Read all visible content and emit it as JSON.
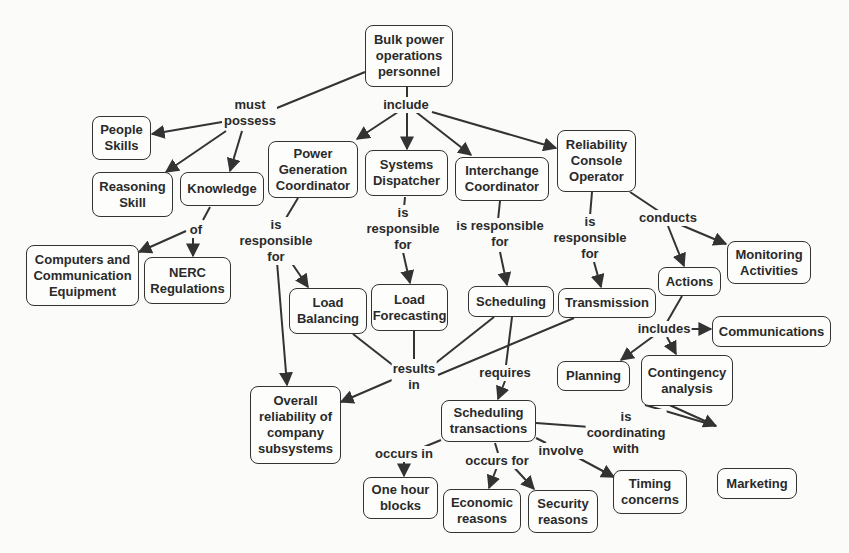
{
  "diagram": {
    "type": "concept-map",
    "colors": {
      "background": "#fbfbfa",
      "stroke": "#333333",
      "text": "#2a2a2a"
    },
    "nodes": [
      {
        "id": "bulk",
        "text": "Bulk power\noperations\npersonnel",
        "x": 365,
        "y": 25,
        "w": 88,
        "h": 62
      },
      {
        "id": "people",
        "text": "People\nSkills",
        "x": 92,
        "y": 116,
        "w": 59,
        "h": 44
      },
      {
        "id": "reasoning",
        "text": "Reasoning\nSkill",
        "x": 92,
        "y": 172,
        "w": 81,
        "h": 45
      },
      {
        "id": "knowledge",
        "text": "Knowledge",
        "x": 180,
        "y": 172,
        "w": 84,
        "h": 34
      },
      {
        "id": "pgc",
        "text": "Power\nGeneration\nCoordinator",
        "x": 268,
        "y": 141,
        "w": 90,
        "h": 57
      },
      {
        "id": "sysdisp",
        "text": "Systems\nDispatcher",
        "x": 365,
        "y": 150,
        "w": 83,
        "h": 46
      },
      {
        "id": "interchange",
        "text": "Interchange\nCoordinator",
        "x": 455,
        "y": 157,
        "w": 94,
        "h": 44
      },
      {
        "id": "rco",
        "text": "Reliability\nConsole\nOperator",
        "x": 557,
        "y": 130,
        "w": 79,
        "h": 62
      },
      {
        "id": "computers",
        "text": "Computers and\nCommunication\nEquipment",
        "x": 26,
        "y": 245,
        "w": 113,
        "h": 61
      },
      {
        "id": "nerc",
        "text": "NERC\nRegulations",
        "x": 144,
        "y": 257,
        "w": 87,
        "h": 47
      },
      {
        "id": "loadbal",
        "text": "Load\nBalancing",
        "x": 289,
        "y": 288,
        "w": 78,
        "h": 46
      },
      {
        "id": "loadfc",
        "text": "Load\nForecasting",
        "x": 371,
        "y": 284,
        "w": 77,
        "h": 47
      },
      {
        "id": "scheduling",
        "text": "Scheduling",
        "x": 468,
        "y": 286,
        "w": 86,
        "h": 31
      },
      {
        "id": "transmission",
        "text": "Transmission",
        "x": 558,
        "y": 288,
        "w": 98,
        "h": 30
      },
      {
        "id": "actions",
        "text": "Actions",
        "x": 658,
        "y": 267,
        "w": 63,
        "h": 29
      },
      {
        "id": "monitoring",
        "text": "Monitoring\nActivities",
        "x": 727,
        "y": 241,
        "w": 84,
        "h": 43
      },
      {
        "id": "communications",
        "text": "Communications",
        "x": 712,
        "y": 316,
        "w": 119,
        "h": 31
      },
      {
        "id": "planning",
        "text": "Planning",
        "x": 557,
        "y": 361,
        "w": 73,
        "h": 30
      },
      {
        "id": "contingency",
        "text": "Contingency\nanalysis",
        "x": 641,
        "y": 355,
        "w": 92,
        "h": 51
      },
      {
        "id": "overall",
        "text": "Overall\nreliability of\ncompany\nsubsystems",
        "x": 250,
        "y": 386,
        "w": 91,
        "h": 78
      },
      {
        "id": "schedtrans",
        "text": "Scheduling\ntransactions",
        "x": 441,
        "y": 400,
        "w": 95,
        "h": 42
      },
      {
        "id": "onehour",
        "text": "One hour\nblocks",
        "x": 363,
        "y": 477,
        "w": 75,
        "h": 42
      },
      {
        "id": "economic",
        "text": "Economic\nreasons",
        "x": 443,
        "y": 489,
        "w": 78,
        "h": 44
      },
      {
        "id": "security",
        "text": "Security\nreasons",
        "x": 528,
        "y": 490,
        "w": 70,
        "h": 43
      },
      {
        "id": "timing",
        "text": "Timing\nconcerns",
        "x": 613,
        "y": 470,
        "w": 74,
        "h": 44
      },
      {
        "id": "marketing",
        "text": "Marketing",
        "x": 717,
        "y": 468,
        "w": 80,
        "h": 31
      }
    ],
    "link_labels": [
      {
        "id": "must_possess",
        "text": "must\npossess",
        "x": 250,
        "y": 97
      },
      {
        "id": "include",
        "text": "include",
        "x": 406,
        "y": 97
      },
      {
        "id": "of",
        "text": "of",
        "x": 196,
        "y": 222
      },
      {
        "id": "pgc_resp",
        "text": "is\nresponsible\nfor",
        "x": 276,
        "y": 217
      },
      {
        "id": "sd_resp",
        "text": "is\nresponsible\nfor",
        "x": 403,
        "y": 205
      },
      {
        "id": "ic_resp",
        "text": "is responsible\nfor",
        "x": 500,
        "y": 218
      },
      {
        "id": "rco_resp",
        "text": "is\nresponsible\nfor",
        "x": 590,
        "y": 214
      },
      {
        "id": "conducts",
        "text": "conducts",
        "x": 668,
        "y": 210
      },
      {
        "id": "includes",
        "text": "includes",
        "x": 664,
        "y": 321
      },
      {
        "id": "results_in",
        "text": "results\nin",
        "x": 414,
        "y": 361
      },
      {
        "id": "requires",
        "text": "requires",
        "x": 505,
        "y": 365
      },
      {
        "id": "coordinating",
        "text": "is\ncoordinating\nwith",
        "x": 626,
        "y": 409
      },
      {
        "id": "occurs_in",
        "text": "occurs in",
        "x": 404,
        "y": 446
      },
      {
        "id": "occurs_for",
        "text": "occurs for",
        "x": 497,
        "y": 453
      },
      {
        "id": "involve",
        "text": "involve",
        "x": 561,
        "y": 443
      }
    ],
    "edges": [
      {
        "from": [
          365,
          72
        ],
        "to": [
          272,
          110
        ],
        "arrow": false
      },
      {
        "from": [
          222,
          122
        ],
        "to": [
          152,
          134
        ],
        "arrow": true
      },
      {
        "from": [
          226,
          131
        ],
        "to": [
          166,
          172
        ],
        "arrow": true
      },
      {
        "from": [
          242,
          131
        ],
        "to": [
          230,
          171
        ],
        "arrow": true
      },
      {
        "from": [
          407,
          87
        ],
        "to": [
          407,
          97
        ],
        "arrow": false
      },
      {
        "from": [
          398,
          112
        ],
        "to": [
          357,
          139
        ],
        "arrow": true
      },
      {
        "from": [
          407,
          112
        ],
        "to": [
          407,
          149
        ],
        "arrow": true
      },
      {
        "from": [
          416,
          112
        ],
        "to": [
          471,
          155
        ],
        "arrow": true
      },
      {
        "from": [
          432,
          112
        ],
        "to": [
          556,
          148
        ],
        "arrow": true
      },
      {
        "from": [
          210,
          207
        ],
        "to": [
          203,
          220
        ],
        "arrow": false
      },
      {
        "from": [
          186,
          231
        ],
        "to": [
          139,
          252
        ],
        "arrow": true
      },
      {
        "from": [
          193,
          237
        ],
        "to": [
          193,
          256
        ],
        "arrow": true
      },
      {
        "from": [
          298,
          198
        ],
        "to": [
          286,
          218
        ],
        "arrow": false
      },
      {
        "from": [
          291,
          262
        ],
        "to": [
          308,
          287
        ],
        "arrow": true
      },
      {
        "from": [
          277,
          262
        ],
        "to": [
          287,
          385
        ],
        "arrow": true
      },
      {
        "from": [
          405,
          197
        ],
        "to": [
          404,
          208
        ],
        "arrow": false
      },
      {
        "from": [
          403,
          252
        ],
        "to": [
          410,
          283
        ],
        "arrow": true
      },
      {
        "from": [
          500,
          201
        ],
        "to": [
          498,
          220
        ],
        "arrow": false
      },
      {
        "from": [
          500,
          252
        ],
        "to": [
          507,
          285
        ],
        "arrow": true
      },
      {
        "from": [
          592,
          192
        ],
        "to": [
          590,
          216
        ],
        "arrow": false
      },
      {
        "from": [
          594,
          262
        ],
        "to": [
          601,
          287
        ],
        "arrow": true
      },
      {
        "from": [
          630,
          192
        ],
        "to": [
          660,
          212
        ],
        "arrow": false
      },
      {
        "from": [
          668,
          226
        ],
        "to": [
          684,
          266
        ],
        "arrow": true
      },
      {
        "from": [
          681,
          225
        ],
        "to": [
          726,
          244
        ],
        "arrow": true
      },
      {
        "from": [
          682,
          296
        ],
        "to": [
          667,
          322
        ],
        "arrow": false
      },
      {
        "from": [
          690,
          329
        ],
        "to": [
          711,
          329
        ],
        "arrow": true
      },
      {
        "from": [
          655,
          335
        ],
        "to": [
          621,
          360
        ],
        "arrow": true
      },
      {
        "from": [
          667,
          337
        ],
        "to": [
          676,
          354
        ],
        "arrow": true
      },
      {
        "from": [
          353,
          334
        ],
        "to": [
          399,
          370
        ],
        "arrow": false
      },
      {
        "from": [
          414,
          331
        ],
        "to": [
          414,
          359
        ],
        "arrow": false
      },
      {
        "from": [
          494,
          317
        ],
        "to": [
          432,
          366
        ],
        "arrow": false
      },
      {
        "from": [
          574,
          318
        ],
        "to": [
          438,
          375
        ],
        "arrow": false
      },
      {
        "from": [
          392,
          380
        ],
        "to": [
          341,
          402
        ],
        "arrow": true
      },
      {
        "from": [
          512,
          317
        ],
        "to": [
          506,
          365
        ],
        "arrow": false
      },
      {
        "from": [
          505,
          381
        ],
        "to": [
          498,
          399
        ],
        "arrow": true
      },
      {
        "from": [
          536,
          423
        ],
        "to": [
          590,
          427
        ],
        "arrow": false
      },
      {
        "from": [
          645,
          405
        ],
        "to": [
          716,
          426
        ],
        "arrow": false
      },
      {
        "from": [
          665,
          403
        ],
        "to": [
          716,
          426
        ],
        "arrow": true
      },
      {
        "from": [
          441,
          440
        ],
        "to": [
          419,
          449
        ],
        "arrow": false
      },
      {
        "from": [
          404,
          461
        ],
        "to": [
          404,
          476
        ],
        "arrow": true
      },
      {
        "from": [
          495,
          443
        ],
        "to": [
          498,
          453
        ],
        "arrow": false
      },
      {
        "from": [
          497,
          467
        ],
        "to": [
          489,
          488
        ],
        "arrow": true
      },
      {
        "from": [
          510,
          463
        ],
        "to": [
          534,
          489
        ],
        "arrow": true
      },
      {
        "from": [
          536,
          438
        ],
        "to": [
          546,
          443
        ],
        "arrow": false
      },
      {
        "from": [
          573,
          455
        ],
        "to": [
          614,
          477
        ],
        "arrow": true
      }
    ]
  }
}
